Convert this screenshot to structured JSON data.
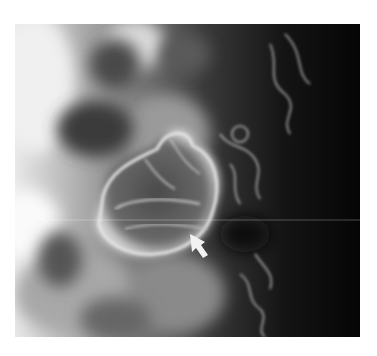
{
  "image": {
    "kind": "radiograph",
    "description": "Grayscale contrast X-ray of abdomen showing a lobulated filling-defect mass outlined by contrast, with adjacent mucosal folds; white arrow points to the lower-right margin of the mass",
    "annotation": {
      "type": "arrow",
      "color": "#f2f2f2",
      "tip": [
        190,
        234
      ],
      "direction": "up-left"
    },
    "colors": {
      "background": "#ffffff",
      "dark_field": "#0a0a0a",
      "bright_contrast": "#f5f5f5"
    }
  }
}
